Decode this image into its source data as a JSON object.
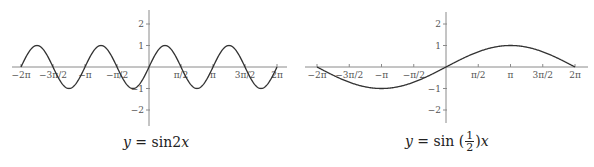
{
  "chart_data": [
    {
      "type": "line",
      "title": "y = sin2x",
      "caption": {
        "y": "y",
        "eq": " = sin2",
        "x": "x"
      },
      "function": "sin(2x)",
      "xlabel": "",
      "ylabel": "",
      "xlim_pi": [
        -2,
        2
      ],
      "ylim": [
        -2.6,
        2.6
      ],
      "grid": false,
      "x_ticks": [
        {
          "value_pi": -2,
          "label": "−2π"
        },
        {
          "value_pi": -1.5,
          "label": "−3π/2"
        },
        {
          "value_pi": -1,
          "label": "−π"
        },
        {
          "value_pi": -0.5,
          "label": "−π/2"
        },
        {
          "value_pi": 0.5,
          "label": "π/2"
        },
        {
          "value_pi": 1,
          "label": "π"
        },
        {
          "value_pi": 1.5,
          "label": "3π/2"
        },
        {
          "value_pi": 2,
          "label": "2π"
        }
      ],
      "y_ticks": [
        {
          "value": 2,
          "label": "2"
        },
        {
          "value": 1,
          "label": "1"
        },
        {
          "value": -1,
          "label": "−1"
        },
        {
          "value": -2,
          "label": "−2"
        }
      ],
      "key_points": [
        {
          "x": "−2π",
          "y": 0
        },
        {
          "x": "−7π/4",
          "y": 1
        },
        {
          "x": "−3π/2",
          "y": 0
        },
        {
          "x": "−5π/4",
          "y": -1
        },
        {
          "x": "−π",
          "y": 0
        },
        {
          "x": "−3π/4",
          "y": 1
        },
        {
          "x": "−π/2",
          "y": 0
        },
        {
          "x": "−π/4",
          "y": -1
        },
        {
          "x": "0",
          "y": 0
        },
        {
          "x": "π/4",
          "y": 1
        },
        {
          "x": "π/2",
          "y": 0
        },
        {
          "x": "3π/4",
          "y": -1
        },
        {
          "x": "π",
          "y": 0
        },
        {
          "x": "5π/4",
          "y": 1
        },
        {
          "x": "3π/2",
          "y": 0
        },
        {
          "x": "7π/4",
          "y": -1
        },
        {
          "x": "2π",
          "y": 0
        }
      ],
      "amplitude": 1,
      "frequency": 2,
      "period": "π"
    },
    {
      "type": "line",
      "title": "y = sin (1/2)x",
      "caption": {
        "y": "y",
        "eq": " = sin (",
        "num": "1",
        "den": "2",
        "close": ")",
        "x": "x"
      },
      "function": "sin(x/2)",
      "xlabel": "",
      "ylabel": "",
      "xlim_pi": [
        -2,
        2
      ],
      "ylim": [
        -2.6,
        2.6
      ],
      "grid": false,
      "x_ticks": [
        {
          "value_pi": -2,
          "label": "−2π"
        },
        {
          "value_pi": -1.5,
          "label": "−3π/2"
        },
        {
          "value_pi": -1,
          "label": "−π"
        },
        {
          "value_pi": -0.5,
          "label": "−π/2"
        },
        {
          "value_pi": 0.5,
          "label": "π/2"
        },
        {
          "value_pi": 1,
          "label": "π"
        },
        {
          "value_pi": 1.5,
          "label": "3π/2"
        },
        {
          "value_pi": 2,
          "label": "2π"
        }
      ],
      "y_ticks": [
        {
          "value": 2,
          "label": "2"
        },
        {
          "value": 1,
          "label": "1"
        },
        {
          "value": -1,
          "label": "−1"
        },
        {
          "value": -2,
          "label": "−2"
        }
      ],
      "key_points": [
        {
          "x": "−2π",
          "y": 0
        },
        {
          "x": "−π",
          "y": -1
        },
        {
          "x": "0",
          "y": 0
        },
        {
          "x": "π",
          "y": 1
        },
        {
          "x": "2π",
          "y": 0
        }
      ],
      "amplitude": 1,
      "frequency": 0.5,
      "period": "4π"
    }
  ],
  "layout": {
    "charts": [
      {
        "origin_x": 149,
        "origin_y": 67,
        "px_per_pi": 64,
        "px_per_unit": 21.5,
        "axis_x_start": 12,
        "axis_x_end": 287,
        "axis_y_top": 10,
        "axis_y_bottom": 126,
        "freq": 2,
        "caption_left": 123,
        "caption_top": 134
      },
      {
        "origin_x": 446,
        "origin_y": 67,
        "px_per_pi": 64.5,
        "px_per_unit": 21.5,
        "axis_x_start": 305,
        "axis_x_end": 588,
        "axis_y_top": 12,
        "axis_y_bottom": 123,
        "freq": 0.5,
        "caption_left": 405,
        "caption_top": 130
      }
    ],
    "colors": {
      "axis": "#8a8a8a",
      "curve": "#333333",
      "text": "#555555"
    }
  }
}
